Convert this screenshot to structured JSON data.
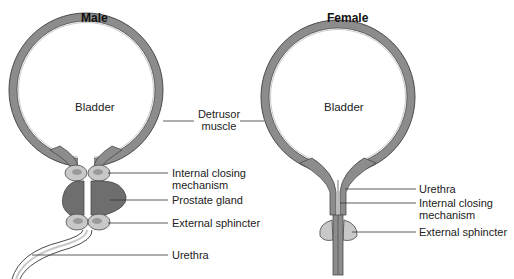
{
  "male": {
    "title": "Male",
    "bladder": "Bladder",
    "labels": {
      "internal_closing_1": "Internal closing",
      "internal_closing_2": "mechanism",
      "prostate": "Prostate gland",
      "external_sphincter": "External sphincter",
      "urethra": "Urethra"
    }
  },
  "shared": {
    "detrusor_1": "Detrusor",
    "detrusor_2": "muscle"
  },
  "female": {
    "title": "Female",
    "bladder": "Bladder",
    "labels": {
      "urethra": "Urethra",
      "internal_closing_1": "Internal closing",
      "internal_closing_2": "mechanism",
      "external_sphincter": "External sphincter"
    }
  },
  "colors": {
    "wall": "#8c8c8c",
    "wall_edge": "#4a4a4a",
    "prostate": "#6e6e6e",
    "sphincter": "#c8c8c8",
    "leader": "#333333"
  }
}
